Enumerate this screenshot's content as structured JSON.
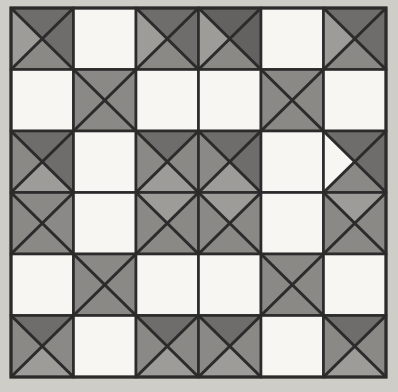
{
  "figure": {
    "name": "quilt-grid-pattern",
    "width": 398,
    "height": 392
  },
  "canvas": {
    "background_color": "#cfcdc8",
    "paper_color": "#d2d0cb"
  },
  "grid": {
    "rows": 6,
    "cols": 6,
    "origin_x": 11,
    "origin_y": 8,
    "cell_width": 62.5,
    "cell_height": 61.5,
    "border_color": "#2b2b2b",
    "outer_border_width": 3,
    "cell_border_width": 2.6,
    "diagonal_width": 3.0
  },
  "palette": {
    "white": "#f7f6f3",
    "light_gray": "#9e9c99",
    "mid_gray": "#8b8986",
    "dark_gray": "#6f6d6b",
    "darker_gray": "#646260",
    "line_dark": "#2b2b2b"
  },
  "legend": {
    "plain_label": "plain block",
    "x_label": "four-triangle X block"
  },
  "chart_data": {
    "type": "heatmap",
    "xlabel": "column",
    "ylabel": "row",
    "categories": [
      "1",
      "2",
      "3",
      "4",
      "5",
      "6"
    ],
    "row_labels": [
      "1",
      "2",
      "3",
      "4",
      "5",
      "6"
    ],
    "cell_types": [
      [
        "x",
        "plain",
        "x",
        "x",
        "plain",
        "x"
      ],
      [
        "plain",
        "x",
        "plain",
        "plain",
        "x",
        "plain"
      ],
      [
        "x",
        "plain",
        "x",
        "x",
        "plain",
        "x"
      ],
      [
        "x",
        "plain",
        "x",
        "x",
        "plain",
        "x"
      ],
      [
        "plain",
        "x",
        "plain",
        "plain",
        "x",
        "plain"
      ],
      [
        "x",
        "plain",
        "x",
        "x",
        "plain",
        "x"
      ]
    ],
    "cells": [
      [
        {
          "type": "x",
          "top": "#6f6d6b",
          "right": "#6f6d6b",
          "bottom": "#8b8986",
          "left": "#9e9c99"
        },
        {
          "type": "plain",
          "fill": "#f7f6f3"
        },
        {
          "type": "x",
          "top": "#6f6d6b",
          "right": "#6f6d6b",
          "bottom": "#8b8986",
          "left": "#9e9c99"
        },
        {
          "type": "x",
          "top": "#646260",
          "right": "#646260",
          "bottom": "#8b8986",
          "left": "#9e9c99"
        },
        {
          "type": "plain",
          "fill": "#f7f6f3"
        },
        {
          "type": "x",
          "top": "#6f6d6b",
          "right": "#6f6d6b",
          "bottom": "#8b8986",
          "left": "#9e9c99"
        }
      ],
      [
        {
          "type": "plain",
          "fill": "#f7f6f3"
        },
        {
          "type": "x",
          "top": "#8b8986",
          "right": "#8b8986",
          "bottom": "#8b8986",
          "left": "#8b8986"
        },
        {
          "type": "plain",
          "fill": "#f7f6f3"
        },
        {
          "type": "plain",
          "fill": "#f7f6f3"
        },
        {
          "type": "x",
          "top": "#8b8986",
          "right": "#8b8986",
          "bottom": "#8b8986",
          "left": "#8b8986"
        },
        {
          "type": "plain",
          "fill": "#f7f6f3"
        }
      ],
      [
        {
          "type": "x",
          "top": "#6f6d6b",
          "right": "#6f6d6b",
          "bottom": "#9e9c99",
          "left": "#8b8986"
        },
        {
          "type": "plain",
          "fill": "#f7f6f3"
        },
        {
          "type": "x",
          "top": "#6f6d6b",
          "right": "#8b8986",
          "bottom": "#9e9c99",
          "left": "#8b8986"
        },
        {
          "type": "x",
          "top": "#6f6d6b",
          "right": "#6f6d6b",
          "bottom": "#9e9c99",
          "left": "#8b8986"
        },
        {
          "type": "plain",
          "fill": "#f7f6f3"
        },
        {
          "type": "x",
          "top": "#6f6d6b",
          "right": "#6f6d6b",
          "bottom": "#8b8986",
          "left": "#f7f6f3"
        }
      ],
      [
        {
          "type": "x",
          "top": "#8b8986",
          "right": "#8b8986",
          "bottom": "#8b8986",
          "left": "#8b8986"
        },
        {
          "type": "plain",
          "fill": "#f7f6f3"
        },
        {
          "type": "x",
          "top": "#9e9c99",
          "right": "#8b8986",
          "bottom": "#8b8986",
          "left": "#8b8986"
        },
        {
          "type": "x",
          "top": "#9e9c99",
          "right": "#8b8986",
          "bottom": "#8b8986",
          "left": "#8b8986"
        },
        {
          "type": "plain",
          "fill": "#f7f6f3"
        },
        {
          "type": "x",
          "top": "#9e9c99",
          "right": "#8b8986",
          "bottom": "#8b8986",
          "left": "#8b8986"
        }
      ],
      [
        {
          "type": "plain",
          "fill": "#f7f6f3"
        },
        {
          "type": "x",
          "top": "#8b8986",
          "right": "#8b8986",
          "bottom": "#8b8986",
          "left": "#8b8986"
        },
        {
          "type": "plain",
          "fill": "#f7f6f3"
        },
        {
          "type": "plain",
          "fill": "#f7f6f3"
        },
        {
          "type": "x",
          "top": "#8b8986",
          "right": "#8b8986",
          "bottom": "#8b8986",
          "left": "#8b8986"
        },
        {
          "type": "plain",
          "fill": "#f7f6f3"
        }
      ],
      [
        {
          "type": "x",
          "top": "#6f6d6b",
          "right": "#8b8986",
          "bottom": "#9e9c99",
          "left": "#8b8986"
        },
        {
          "type": "plain",
          "fill": "#f7f6f3"
        },
        {
          "type": "x",
          "top": "#6f6d6b",
          "right": "#8b8986",
          "bottom": "#9e9c99",
          "left": "#8b8986"
        },
        {
          "type": "x",
          "top": "#6f6d6b",
          "right": "#8b8986",
          "bottom": "#9e9c99",
          "left": "#8b8986"
        },
        {
          "type": "plain",
          "fill": "#f7f6f3"
        },
        {
          "type": "x",
          "top": "#6f6d6b",
          "right": "#8b8986",
          "bottom": "#9e9c99",
          "left": "#8b8986"
        }
      ]
    ]
  }
}
